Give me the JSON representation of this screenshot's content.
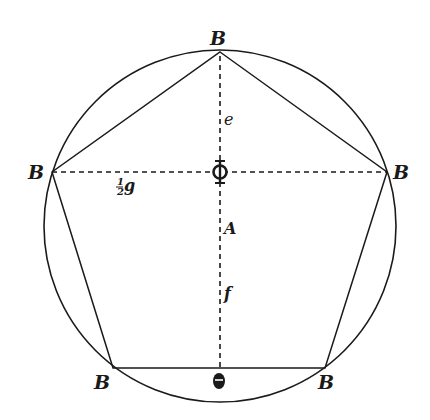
{
  "figure": {
    "type": "geometric construction",
    "colors": {
      "background": "#ffffff",
      "ink": "#1a1a1a"
    },
    "circle": {
      "cx": 220,
      "cy": 226,
      "r": 176
    },
    "pentagon_vertices": [
      {
        "name": "top",
        "x": 220,
        "y": 52
      },
      {
        "name": "right",
        "x": 387,
        "y": 172
      },
      {
        "name": "bottom-right",
        "x": 325,
        "y": 368
      },
      {
        "name": "bottom-left",
        "x": 113,
        "y": 368
      },
      {
        "name": "left",
        "x": 52,
        "y": 172
      }
    ],
    "dashed_lines": [
      {
        "name": "vertical-axis",
        "from": [
          220,
          56
        ],
        "to": [
          220,
          368
        ]
      },
      {
        "name": "horizontal-diagonal",
        "from": [
          52,
          172
        ],
        "to": [
          387,
          172
        ]
      }
    ]
  },
  "labels": {
    "vertex_top": "B",
    "vertex_left": "B",
    "vertex_right": "B",
    "vertex_bottom_left": "B",
    "vertex_bottom_right": "B",
    "center": "Φ",
    "segment_e": "e",
    "segment_A": "A",
    "segment_f": "f",
    "half_g_num": "1",
    "half_g_den": "2",
    "half_g_var": "g",
    "bottom_mid": "θ"
  }
}
